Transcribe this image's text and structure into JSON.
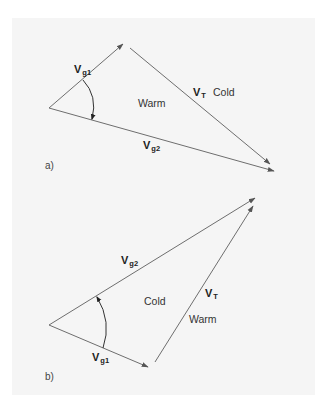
{
  "colors": {
    "background": "#ffffff",
    "panel": "#f5f5f5",
    "vector_line": "#6e6e6e",
    "arc": "#333333",
    "text": "#333333"
  },
  "diagram_a": {
    "panel_label": "a)",
    "vectors": {
      "vg1": {
        "main": "V",
        "sub": "g1",
        "from": [
          49,
          108
        ],
        "to": [
          123,
          44
        ]
      },
      "vg2": {
        "main": "V",
        "sub": "g2",
        "from": [
          49,
          108
        ],
        "to": [
          274,
          171
        ]
      },
      "vt": {
        "main": "V",
        "sub": "T",
        "from": [
          130,
          48
        ],
        "to": [
          270,
          164
        ]
      }
    },
    "region_labels": {
      "inside": "Warm",
      "outside": "Cold"
    },
    "angle_arrow": "clockwise from Vg1 to Vg2"
  },
  "diagram_b": {
    "panel_label": "b)",
    "vectors": {
      "vg1": {
        "main": "V",
        "sub": "g1",
        "from": [
          49,
          325
        ],
        "to": [
          148,
          367
        ]
      },
      "vg2": {
        "main": "V",
        "sub": "g2",
        "from": [
          49,
          325
        ],
        "to": [
          255,
          198
        ]
      },
      "vt": {
        "main": "V",
        "sub": "T",
        "from": [
          155,
          362
        ],
        "to": [
          253,
          206
        ]
      }
    },
    "region_labels": {
      "inside": "Cold",
      "outside": "Warm"
    },
    "angle_arrow": "counterclockwise from Vg1 to Vg2"
  }
}
